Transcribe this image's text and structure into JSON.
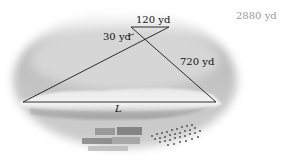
{
  "figure": {
    "labels": {
      "top_side": "120 yd",
      "small_side": "30 yd",
      "large_side": "720 yd",
      "base": "L",
      "answer_note": "2880 yd"
    },
    "colors": {
      "line": "#1a1a1a",
      "answer_text": "#9a9a9a"
    }
  }
}
